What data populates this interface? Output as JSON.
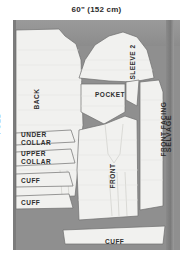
{
  "diagram": {
    "type": "sewing-pattern-cutting-layout",
    "width_caption": "60\" (152 cm)",
    "fabric_color": "#8f8f8f",
    "piece_color": "#f1f1ef",
    "edges": {
      "left_label": "FOLD",
      "right_label": "SELVAGE"
    },
    "pieces": [
      {
        "id": "back",
        "label": "BACK",
        "orientation": "vertical"
      },
      {
        "id": "sleeve-2",
        "label": "SLEEVE 2",
        "orientation": "vertical"
      },
      {
        "id": "pocket",
        "label": "POCKET",
        "orientation": "horizontal"
      },
      {
        "id": "front-facing",
        "label": "FRONT FACING",
        "orientation": "vertical"
      },
      {
        "id": "front",
        "label": "FRONT",
        "orientation": "vertical"
      },
      {
        "id": "under-collar",
        "label": "UNDER\nCOLLAR",
        "line1": "UNDER",
        "line2": "COLLAR",
        "orientation": "horizontal"
      },
      {
        "id": "upper-collar",
        "label": "UPPER\nCOLLAR",
        "line1": "UPPER",
        "line2": "COLLAR",
        "orientation": "horizontal"
      },
      {
        "id": "cuff-1",
        "label": "CUFF",
        "orientation": "horizontal"
      },
      {
        "id": "cuff-2",
        "label": "CUFF",
        "orientation": "horizontal"
      },
      {
        "id": "cuff-3",
        "label": "CUFF",
        "orientation": "horizontal"
      }
    ]
  }
}
